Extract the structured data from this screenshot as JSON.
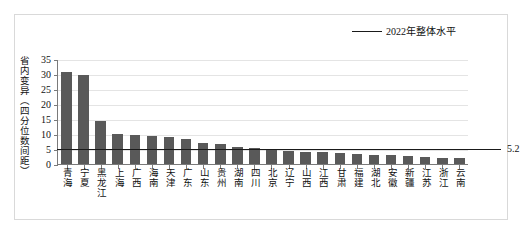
{
  "chart_data": {
    "type": "bar",
    "title": "",
    "xlabel": "",
    "ylabel": "省内变异（四分位数间距）",
    "ylim": [
      0,
      35
    ],
    "yticks": [
      0,
      5,
      10,
      15,
      20,
      25,
      30,
      35
    ],
    "grid": true,
    "legend_position": "top-right",
    "legend": [
      "2022年整体水平"
    ],
    "categories": [
      "青海",
      "宁夏",
      "黑龙江",
      "上海",
      "广西",
      "海南",
      "天津",
      "广东",
      "山东",
      "贵州",
      "湖南",
      "四川",
      "北京",
      "辽宁",
      "山西",
      "江西",
      "甘肃",
      "福建",
      "湖北",
      "安徽",
      "新疆",
      "江苏",
      "浙江",
      "云南"
    ],
    "values": [
      31.0,
      30.0,
      14.8,
      10.2,
      9.9,
      9.7,
      9.4,
      8.8,
      7.4,
      6.9,
      6.0,
      5.6,
      5.4,
      4.7,
      4.3,
      4.2,
      4.0,
      3.7,
      3.4,
      3.2,
      2.9,
      2.6,
      2.4,
      2.2
    ],
    "reference_line": {
      "label": "2022年整体水平",
      "value": 5.2,
      "value_label": "5.2"
    },
    "series": [
      {
        "name": "省内变异（四分位数间距）",
        "values": [
          31.0,
          30.0,
          14.8,
          10.2,
          9.9,
          9.7,
          9.4,
          8.8,
          7.4,
          6.9,
          6.0,
          5.6,
          5.4,
          4.7,
          4.3,
          4.2,
          4.0,
          3.7,
          3.4,
          3.2,
          2.9,
          2.6,
          2.4,
          2.2
        ]
      }
    ],
    "colors": {
      "bar": "#595959",
      "reference_line": "#1a1a1a",
      "grid": "#e4e4e4",
      "axis": "#7a7a7a",
      "frame": "#d9d9d9",
      "background": "#ffffff"
    }
  }
}
